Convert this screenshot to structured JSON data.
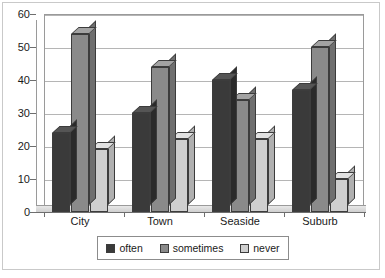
{
  "chart_data": {
    "type": "bar",
    "title": "",
    "subtitle": "",
    "xlabel": "",
    "ylabel": "",
    "categories": [
      "City",
      "Town",
      "Seaside",
      "Suburb"
    ],
    "series": [
      {
        "name": "often",
        "values": [
          24,
          30,
          40,
          37
        ],
        "color": "#3a3a3a"
      },
      {
        "name": "sometimes",
        "values": [
          54,
          44,
          34,
          50
        ],
        "color": "#8a8a8a"
      },
      {
        "name": "never",
        "values": [
          19,
          22,
          22,
          10
        ],
        "color": "#cfcfcf"
      }
    ],
    "ylim": [
      0,
      60
    ],
    "yticks": [
      0,
      10,
      20,
      30,
      40,
      50,
      60
    ],
    "ytick_labels": [
      "0",
      "10",
      "20",
      "30",
      "40",
      "50",
      "60"
    ],
    "grid": true,
    "grid_axis": "y",
    "legend_position": "bottom",
    "style": "3d-column"
  },
  "legend": {
    "items": [
      {
        "label": "often",
        "swatch_color": "#3a3a3a",
        "swatch_name": "legend-swatch-often"
      },
      {
        "label": "sometimes",
        "swatch_color": "#8a8a8a",
        "swatch_name": "legend-swatch-sometimes"
      },
      {
        "label": "never",
        "swatch_color": "#cfcfcf",
        "swatch_name": "legend-swatch-never"
      }
    ]
  },
  "colors": {
    "often_front": "#3a3a3a",
    "often_top": "#555555",
    "often_side": "#2a2a2a",
    "sometimes_front": "#8a8a8a",
    "sometimes_top": "#a3a3a3",
    "sometimes_side": "#6f6f6f",
    "never_front": "#cfcfcf",
    "never_top": "#e2e2e2",
    "never_side": "#b0b0b0",
    "axis": "#6e6e6e",
    "gridline": "#b5b5b5",
    "frame": "#c9c9c9",
    "text": "#1a1a1a",
    "background": "#ffffff"
  }
}
